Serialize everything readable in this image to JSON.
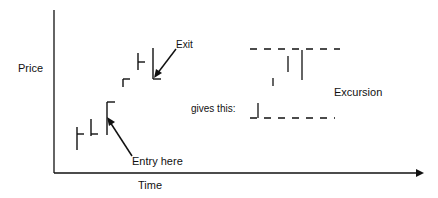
{
  "axes": {
    "y_label": "Price",
    "x_label": "Time"
  },
  "annotations": {
    "exit": "Exit",
    "entry": "Entry here",
    "gives": "gives this:",
    "excursion": "Excursion"
  },
  "colors": {
    "stroke": "#111111",
    "background": "#ffffff"
  }
}
